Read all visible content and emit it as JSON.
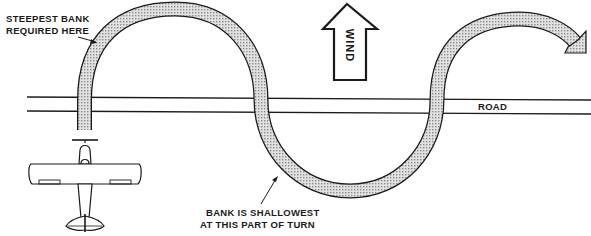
{
  "labels": {
    "steepest_line1": "STEEPEST BANK",
    "steepest_line2": "REQUIRED HERE",
    "wind": "WIND",
    "road": "ROAD",
    "shallowest_line1": "BANK IS SHALLOWEST",
    "shallowest_line2": "AT THIS PART OF TURN"
  },
  "icons": {
    "wind_arrow": "up-arrow-icon",
    "airplane": "airplane-icon",
    "path_arrowhead": "arrowhead-icon"
  },
  "colors": {
    "line": "#1a1a1a",
    "path_fill": "#c8c8c8",
    "background": "#ffffff"
  }
}
